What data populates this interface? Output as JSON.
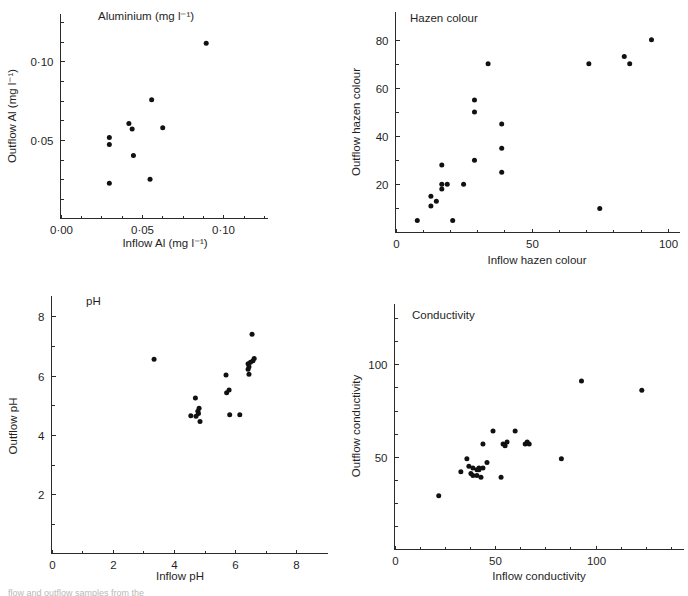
{
  "figure": {
    "caption": "flow and outflow samples from the"
  },
  "chart_data": [
    {
      "id": "aluminium",
      "type": "scatter",
      "title": "Aluminium (mg l⁻¹)",
      "xlabel": "Inflow Al (mg l⁻¹)",
      "ylabel": "Outflow Al (mg l⁻¹)",
      "xlim": [
        0.0,
        0.125
      ],
      "ylim": [
        0.0,
        0.125
      ],
      "xticks": [
        0.0,
        0.05,
        0.1
      ],
      "xticklabels": [
        "0·00",
        "0·05",
        "0·10"
      ],
      "yticks": [
        0.05,
        0.1
      ],
      "yticklabels": [
        "0·05",
        "0·10"
      ],
      "xminor": [
        0.0125,
        0.025,
        0.0375,
        0.0625,
        0.075,
        0.0875,
        0.1125,
        0.125
      ],
      "yminor": [
        0.0125,
        0.025,
        0.0375,
        0.0625,
        0.075,
        0.0875,
        0.1125,
        0.125
      ],
      "grid": false,
      "legend": "none",
      "points": [
        {
          "x": 0.03,
          "y": 0.0515
        },
        {
          "x": 0.03,
          "y": 0.047
        },
        {
          "x": 0.03,
          "y": 0.0225
        },
        {
          "x": 0.042,
          "y": 0.0605
        },
        {
          "x": 0.044,
          "y": 0.057
        },
        {
          "x": 0.0448,
          "y": 0.04
        },
        {
          "x": 0.055,
          "y": 0.025
        },
        {
          "x": 0.056,
          "y": 0.0755
        },
        {
          "x": 0.0628,
          "y": 0.0578
        },
        {
          "x": 0.0895,
          "y": 0.1115
        }
      ]
    },
    {
      "id": "hazen",
      "type": "scatter",
      "title": "Hazen colour",
      "xlabel": "Inflow hazen colour",
      "ylabel": "Outflow hazen colour",
      "xlim": [
        0,
        103
      ],
      "ylim": [
        0,
        84
      ],
      "xticks": [
        0,
        50,
        100
      ],
      "xticklabels": [
        "0",
        "50",
        "100"
      ],
      "yticks": [
        20,
        40,
        60,
        80
      ],
      "yticklabels": [
        "20",
        "40",
        "60",
        "80"
      ],
      "xminor": [
        10,
        20,
        30,
        40,
        60,
        70,
        80,
        90
      ],
      "yminor": [
        10,
        30,
        50,
        70
      ],
      "grid": false,
      "legend": "none",
      "points": [
        {
          "x": 8,
          "y": 5
        },
        {
          "x": 13,
          "y": 15
        },
        {
          "x": 13,
          "y": 11
        },
        {
          "x": 15,
          "y": 13
        },
        {
          "x": 17,
          "y": 28
        },
        {
          "x": 17,
          "y": 20
        },
        {
          "x": 17,
          "y": 18
        },
        {
          "x": 19,
          "y": 20
        },
        {
          "x": 21,
          "y": 5
        },
        {
          "x": 25,
          "y": 20
        },
        {
          "x": 29,
          "y": 55
        },
        {
          "x": 29,
          "y": 50
        },
        {
          "x": 29,
          "y": 30
        },
        {
          "x": 34,
          "y": 70
        },
        {
          "x": 39,
          "y": 45
        },
        {
          "x": 39,
          "y": 35
        },
        {
          "x": 39,
          "y": 25
        },
        {
          "x": 71,
          "y": 70
        },
        {
          "x": 75,
          "y": 10
        },
        {
          "x": 84,
          "y": 73
        },
        {
          "x": 86,
          "y": 70
        },
        {
          "x": 94,
          "y": 80
        }
      ]
    },
    {
      "id": "ph",
      "type": "scatter",
      "title": "pH",
      "xlabel": "Inflow pH",
      "ylabel": "Outflow pH",
      "xlim": [
        0,
        8.9
      ],
      "ylim": [
        0,
        8.35
      ],
      "xticks": [
        0,
        2,
        4,
        6,
        8
      ],
      "xticklabels": [
        "0",
        "2",
        "4",
        "6",
        "8"
      ],
      "yticks": [
        2,
        4,
        6,
        8
      ],
      "yticklabels": [
        "2",
        "4",
        "6",
        "8"
      ],
      "xminor": [
        1,
        3,
        5,
        7
      ],
      "yminor": [
        1,
        3,
        5,
        7
      ],
      "grid": false,
      "legend": "none",
      "points": [
        {
          "x": 3.35,
          "y": 6.55
        },
        {
          "x": 4.55,
          "y": 4.65
        },
        {
          "x": 4.7,
          "y": 5.25
        },
        {
          "x": 4.78,
          "y": 4.8
        },
        {
          "x": 4.82,
          "y": 4.9
        },
        {
          "x": 4.8,
          "y": 4.72
        },
        {
          "x": 4.72,
          "y": 4.63
        },
        {
          "x": 4.85,
          "y": 4.45
        },
        {
          "x": 5.7,
          "y": 6.02
        },
        {
          "x": 5.72,
          "y": 5.42
        },
        {
          "x": 5.8,
          "y": 5.52
        },
        {
          "x": 5.82,
          "y": 4.68
        },
        {
          "x": 6.15,
          "y": 4.68
        },
        {
          "x": 6.42,
          "y": 6.4
        },
        {
          "x": 6.45,
          "y": 6.3
        },
        {
          "x": 6.42,
          "y": 6.22
        },
        {
          "x": 6.45,
          "y": 6.05
        },
        {
          "x": 6.5,
          "y": 6.45
        },
        {
          "x": 6.58,
          "y": 6.5
        },
        {
          "x": 6.62,
          "y": 6.58
        },
        {
          "x": 6.55,
          "y": 7.4
        }
      ]
    },
    {
      "id": "conductivity",
      "type": "scatter",
      "title": "Conductivity",
      "xlabel": "Inflow conductivity",
      "ylabel": "Outflow conductivity",
      "xlim": [
        0,
        142
      ],
      "ylim": [
        0,
        125
      ],
      "xticks": [
        0,
        50,
        100
      ],
      "xticklabels": [
        "0",
        "50",
        "100"
      ],
      "yticks": [
        50,
        100
      ],
      "yticklabels": [
        "50",
        "100"
      ],
      "xminor": [
        12.5,
        25,
        37.5,
        62.5,
        75,
        87.5,
        112.5,
        125,
        137.5
      ],
      "yminor": [
        12.5,
        25,
        37.5,
        62.5,
        75,
        87.5,
        112.5,
        125
      ],
      "grid": false,
      "legend": "none",
      "points": [
        {
          "x": 22,
          "y": 29
        },
        {
          "x": 33,
          "y": 42
        },
        {
          "x": 36,
          "y": 49
        },
        {
          "x": 37,
          "y": 45
        },
        {
          "x": 38,
          "y": 41
        },
        {
          "x": 39,
          "y": 44
        },
        {
          "x": 39,
          "y": 40
        },
        {
          "x": 41,
          "y": 43
        },
        {
          "x": 41,
          "y": 40
        },
        {
          "x": 42,
          "y": 44
        },
        {
          "x": 42,
          "y": 43
        },
        {
          "x": 43,
          "y": 39
        },
        {
          "x": 44,
          "y": 44
        },
        {
          "x": 44,
          "y": 57
        },
        {
          "x": 46,
          "y": 47
        },
        {
          "x": 49,
          "y": 64
        },
        {
          "x": 53,
          "y": 39
        },
        {
          "x": 54,
          "y": 57
        },
        {
          "x": 55,
          "y": 56
        },
        {
          "x": 56,
          "y": 58
        },
        {
          "x": 60,
          "y": 64
        },
        {
          "x": 65,
          "y": 57
        },
        {
          "x": 66,
          "y": 58
        },
        {
          "x": 67,
          "y": 57
        },
        {
          "x": 83,
          "y": 49
        },
        {
          "x": 93,
          "y": 91
        },
        {
          "x": 123,
          "y": 86
        }
      ]
    }
  ]
}
